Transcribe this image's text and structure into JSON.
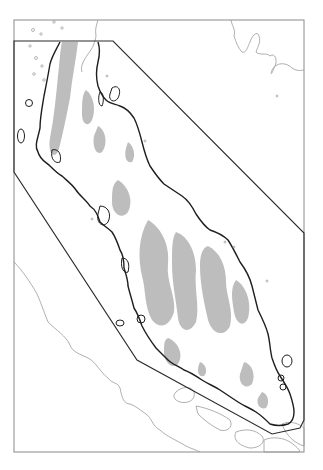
{
  "map": {
    "type": "regional outline map",
    "subject": "Malay Peninsula",
    "colors": {
      "background": "#ffffff",
      "frame": "#8a8a8a",
      "boundary_polygon": "#2a2a2a",
      "coastline": "#1e1e1e",
      "neighbor_coast": "#9a9a9a",
      "highland": "#bdbdbd",
      "contour": "#a8a8a8"
    },
    "frame": {
      "x": 14,
      "y": 20,
      "width": 290,
      "height": 432
    },
    "study_area_polygon": [
      [
        14,
        41
      ],
      [
        113,
        41
      ],
      [
        304,
        233
      ],
      [
        304,
        420
      ],
      [
        300,
        428
      ],
      [
        272,
        434
      ],
      [
        137,
        360
      ],
      [
        14,
        172
      ]
    ],
    "labels": []
  }
}
